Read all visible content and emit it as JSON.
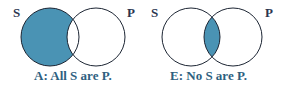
{
  "diagrams": [
    {
      "id": "A",
      "caption": "A: All S are P.",
      "left_label": "S",
      "right_label": "P",
      "shaded_region": "S only (S minus P)",
      "shade_color": "#4a93b4"
    },
    {
      "id": "E",
      "caption": "E: No S are P.",
      "left_label": "S",
      "right_label": "P",
      "shaded_region": "S and P intersection",
      "shade_color": "#4a93b4"
    }
  ],
  "colors": {
    "outline": "#1c2533",
    "label_text": "#2a3550",
    "caption_text": "#2e5f7f"
  }
}
